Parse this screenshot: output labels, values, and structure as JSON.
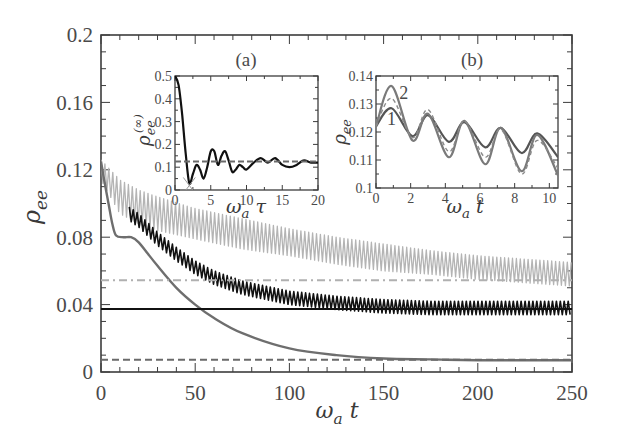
{
  "figure": {
    "panel_a_label": "(a)",
    "panel_b_label": "(b)",
    "curve_label_1": "1",
    "curve_label_2": "2"
  },
  "colors": {
    "frame": "#3c3c3c",
    "black_curve": "#111111",
    "dark_gray_curve": "#6e6e6e",
    "light_gray_curve": "#b4b4b4",
    "dashdot_line": "#b0b0b0",
    "dashed_line": "#6a6a6a"
  },
  "chart_data": [
    {
      "id": "main",
      "type": "line",
      "title": "",
      "xlabel": "ω_a t",
      "ylabel": "ρ_ee",
      "xlim": [
        0,
        250
      ],
      "ylim": [
        0,
        0.2
      ],
      "xticks": [
        0,
        50,
        100,
        150,
        200,
        250
      ],
      "xtick_labels": [
        "0",
        "50",
        "100",
        "150",
        "200",
        "250"
      ],
      "yticks": [
        0,
        0.04,
        0.08,
        0.12,
        0.16,
        0.2
      ],
      "ytick_labels": [
        "0",
        "0.04",
        "0.08",
        "0.12",
        "0.16",
        "0.2"
      ],
      "grid": false,
      "legend": null,
      "series": [
        {
          "name": "light gray oscillating (upper band)",
          "style": "solid-oscillating",
          "color": "#b4b4b4",
          "x": [
            0,
            5,
            10,
            20,
            30,
            50,
            75,
            100,
            125,
            150,
            175,
            200,
            225,
            250
          ],
          "center": [
            0.12,
            0.112,
            0.104,
            0.098,
            0.094,
            0.088,
            0.082,
            0.077,
            0.072,
            0.068,
            0.065,
            0.062,
            0.06,
            0.058
          ],
          "amplitude": [
            0.006,
            0.008,
            0.01,
            0.01,
            0.01,
            0.009,
            0.009,
            0.008,
            0.008,
            0.008,
            0.007,
            0.007,
            0.007,
            0.007
          ]
        },
        {
          "name": "black oscillating (middle band)",
          "style": "solid-oscillating",
          "color": "#111111",
          "x": [
            15,
            20,
            30,
            40,
            50,
            60,
            75,
            100,
            125,
            150,
            175,
            200,
            225,
            250
          ],
          "center": [
            0.094,
            0.09,
            0.079,
            0.07,
            0.062,
            0.056,
            0.05,
            0.044,
            0.041,
            0.039,
            0.038,
            0.038,
            0.038,
            0.038
          ],
          "amplitude": [
            0.004,
            0.004,
            0.004,
            0.004,
            0.004,
            0.004,
            0.004,
            0.004,
            0.004,
            0.004,
            0.004,
            0.004,
            0.004,
            0.004
          ]
        },
        {
          "name": "dark gray smooth decay",
          "style": "solid",
          "color": "#6e6e6e",
          "x": [
            0,
            2,
            4,
            6,
            8,
            12,
            16,
            20,
            25,
            30,
            40,
            50,
            60,
            75,
            100,
            125,
            150,
            175,
            200,
            250
          ],
          "y": [
            0.125,
            0.112,
            0.1,
            0.088,
            0.081,
            0.08,
            0.08,
            0.077,
            0.07,
            0.063,
            0.05,
            0.04,
            0.032,
            0.023,
            0.014,
            0.01,
            0.008,
            0.0075,
            0.007,
            0.007
          ]
        },
        {
          "name": "steady-state reference (dash-dot)",
          "style": "dashdot",
          "color": "#b0b0b0",
          "x": [
            0,
            250
          ],
          "y": [
            0.0545,
            0.0545
          ]
        },
        {
          "name": "steady-state reference (solid black)",
          "style": "solid",
          "color": "#111111",
          "x": [
            0,
            250
          ],
          "y": [
            0.0374,
            0.0374
          ]
        },
        {
          "name": "steady-state reference (dashed)",
          "style": "dashed",
          "color": "#6a6a6a",
          "x": [
            0,
            250
          ],
          "y": [
            0.0072,
            0.0072
          ]
        }
      ]
    },
    {
      "id": "inset_a",
      "type": "line",
      "title": "(a)",
      "xlabel": "ω_a τ",
      "ylabel": "ρ_ee^(∞)",
      "xlim": [
        0,
        20
      ],
      "ylim": [
        0,
        0.5
      ],
      "xticks": [
        0,
        5,
        10,
        15,
        20
      ],
      "xtick_labels": [
        "0",
        "5",
        "10",
        "15",
        "20"
      ],
      "yticks": [
        0,
        0.1,
        0.2,
        0.3,
        0.4,
        0.5
      ],
      "ytick_labels": [
        "0",
        "0.1",
        "0.2",
        "0.3",
        "0.4",
        "0.5"
      ],
      "grid": false,
      "series": [
        {
          "name": "ρ_ee^(∞) vs ω_a τ",
          "style": "solid",
          "color": "#111111",
          "x": [
            0,
            0.5,
            1,
            1.5,
            2,
            2.5,
            3,
            3.5,
            4,
            4.5,
            5,
            5.5,
            6,
            6.5,
            7,
            7.5,
            8,
            8.5,
            9,
            9.5,
            10,
            11,
            12,
            13,
            14,
            15,
            16,
            17,
            18,
            19,
            20
          ],
          "y": [
            0.5,
            0.46,
            0.33,
            0.16,
            0.03,
            0.07,
            0.11,
            0.09,
            0.05,
            0.1,
            0.17,
            0.17,
            0.11,
            0.15,
            0.17,
            0.13,
            0.08,
            0.09,
            0.11,
            0.1,
            0.09,
            0.12,
            0.14,
            0.12,
            0.14,
            0.11,
            0.1,
            0.11,
            0.13,
            0.12,
            0.12
          ]
        },
        {
          "name": "reference (dashed)",
          "style": "dashed",
          "color": "#6a6a6a",
          "x": [
            0,
            20
          ],
          "y": [
            0.125,
            0.125
          ]
        },
        {
          "name": "marker (gray cross)",
          "style": "marker-x",
          "color": "#9a9a9a",
          "x": [
            2
          ],
          "y": [
            0.02
          ]
        }
      ]
    },
    {
      "id": "inset_b",
      "type": "line",
      "title": "(b)",
      "xlabel": "ω_a t",
      "ylabel": "ρ_ee",
      "xlim": [
        0,
        10.5
      ],
      "ylim": [
        0.1,
        0.14
      ],
      "xticks": [
        0,
        2,
        4,
        6,
        8,
        10
      ],
      "xtick_labels": [
        "0",
        "2",
        "4",
        "6",
        "8",
        "10"
      ],
      "yticks": [
        0.1,
        0.11,
        0.12,
        0.13,
        0.14
      ],
      "ytick_labels": [
        "0.1",
        "0.11",
        "0.12",
        "0.13",
        "0.14"
      ],
      "grid": false,
      "annotations": [
        {
          "text": "1",
          "x": 0.9,
          "y": 0.1245
        },
        {
          "text": "2",
          "x": 1.6,
          "y": 0.134
        }
      ],
      "series": [
        {
          "name": "1",
          "style": "solid",
          "color": "#555555",
          "x": [
            0,
            0.9,
            2.1,
            3.0,
            4.2,
            5.1,
            6.3,
            7.2,
            8.4,
            9.3,
            10.5
          ],
          "y": [
            0.122,
            0.1285,
            0.1185,
            0.126,
            0.1165,
            0.1235,
            0.1145,
            0.1215,
            0.1125,
            0.1195,
            0.111
          ]
        },
        {
          "name": "2",
          "style": "solid",
          "color": "#7a7a7a",
          "x": [
            0,
            0.9,
            2.1,
            3.0,
            4.2,
            5.1,
            6.3,
            7.2,
            8.4,
            9.3,
            10.5
          ],
          "y": [
            0.122,
            0.1364,
            0.117,
            0.1265,
            0.111,
            0.124,
            0.1085,
            0.1215,
            0.106,
            0.119,
            0.1045
          ]
        },
        {
          "name": "dashed comparison",
          "style": "dashed",
          "color": "#8a8a8a",
          "x": [
            0,
            0.9,
            2.1,
            3.0,
            4.2,
            5.1,
            6.3,
            7.2,
            8.4,
            9.3,
            10.5
          ],
          "y": [
            0.122,
            0.132,
            0.118,
            0.128,
            0.113,
            0.124,
            0.111,
            0.121,
            0.105,
            0.117,
            0.107
          ]
        }
      ]
    }
  ]
}
